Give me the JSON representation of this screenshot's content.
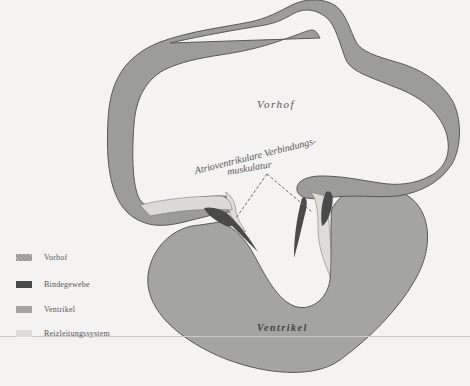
{
  "figure": {
    "labels": {
      "vorhof": "Vorhof",
      "ventrikel": "Ventrikel",
      "avm_line1": "Atrioventrikulare Verbindungs-",
      "avm_line2": "muskulatur"
    }
  },
  "legend": {
    "items": [
      {
        "label": "Vorhof",
        "color": "#9a9a98",
        "pattern": "hatched"
      },
      {
        "label": "Bindegewebe",
        "color": "#4a4a4a",
        "pattern": "solid"
      },
      {
        "label": "Ventrikel",
        "color": "#a3a3a1",
        "pattern": "solid"
      },
      {
        "label": "Reizleitungssystem",
        "color": "#dcdcd9",
        "pattern": "solid"
      }
    ]
  },
  "colors": {
    "background": "#f4f3f1",
    "vorhof": "#9c9c9a",
    "ventrikel": "#a4a4a2",
    "bindegewebe": "#4a4a4a",
    "reizleitungssystem": "#dedcd8",
    "outline": "#5a5a58"
  }
}
